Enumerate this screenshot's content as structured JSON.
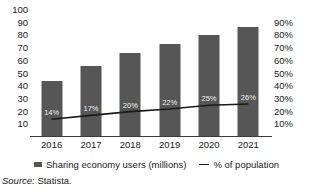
{
  "chart_data": {
    "type": "bar",
    "title": "",
    "xlabel": "",
    "ylabel": "",
    "categories": [
      "2016",
      "2017",
      "2018",
      "2019",
      "2020",
      "2021"
    ],
    "series": [
      {
        "name": "Sharing economy users (millions)",
        "type": "bar",
        "axis": "left",
        "values": [
          44,
          56,
          66,
          73,
          80,
          86.5
        ],
        "color": "#565656"
      },
      {
        "name": "% of population",
        "type": "line",
        "axis": "right",
        "values": [
          14,
          17,
          20,
          22,
          25,
          26
        ],
        "data_labels": [
          "14%",
          "17%",
          "20%",
          "22%",
          "25%",
          "26%"
        ],
        "color": "#1a1a1a"
      }
    ],
    "ylim": [
      0,
      100
    ],
    "y_ticks": [
      10,
      20,
      30,
      40,
      50,
      60,
      70,
      80,
      90,
      100
    ],
    "y_tick_labels": [
      "10",
      "20",
      "30",
      "40",
      "50",
      "60",
      "70",
      "80",
      "90",
      "100"
    ],
    "ylim_right": [
      0,
      100
    ],
    "y_ticks_right": [
      10,
      20,
      30,
      40,
      50,
      60,
      70,
      80,
      90
    ],
    "y_tick_labels_right": [
      "10%",
      "20%",
      "30%",
      "40%",
      "50%",
      "60%",
      "70%",
      "80%",
      "90%"
    ],
    "grid": false,
    "legend_position": "bottom"
  },
  "legend": {
    "bars_label": "Sharing economy users (millions)",
    "line_label": "% of population"
  },
  "source": {
    "label": "Source:",
    "value": "Statista."
  }
}
